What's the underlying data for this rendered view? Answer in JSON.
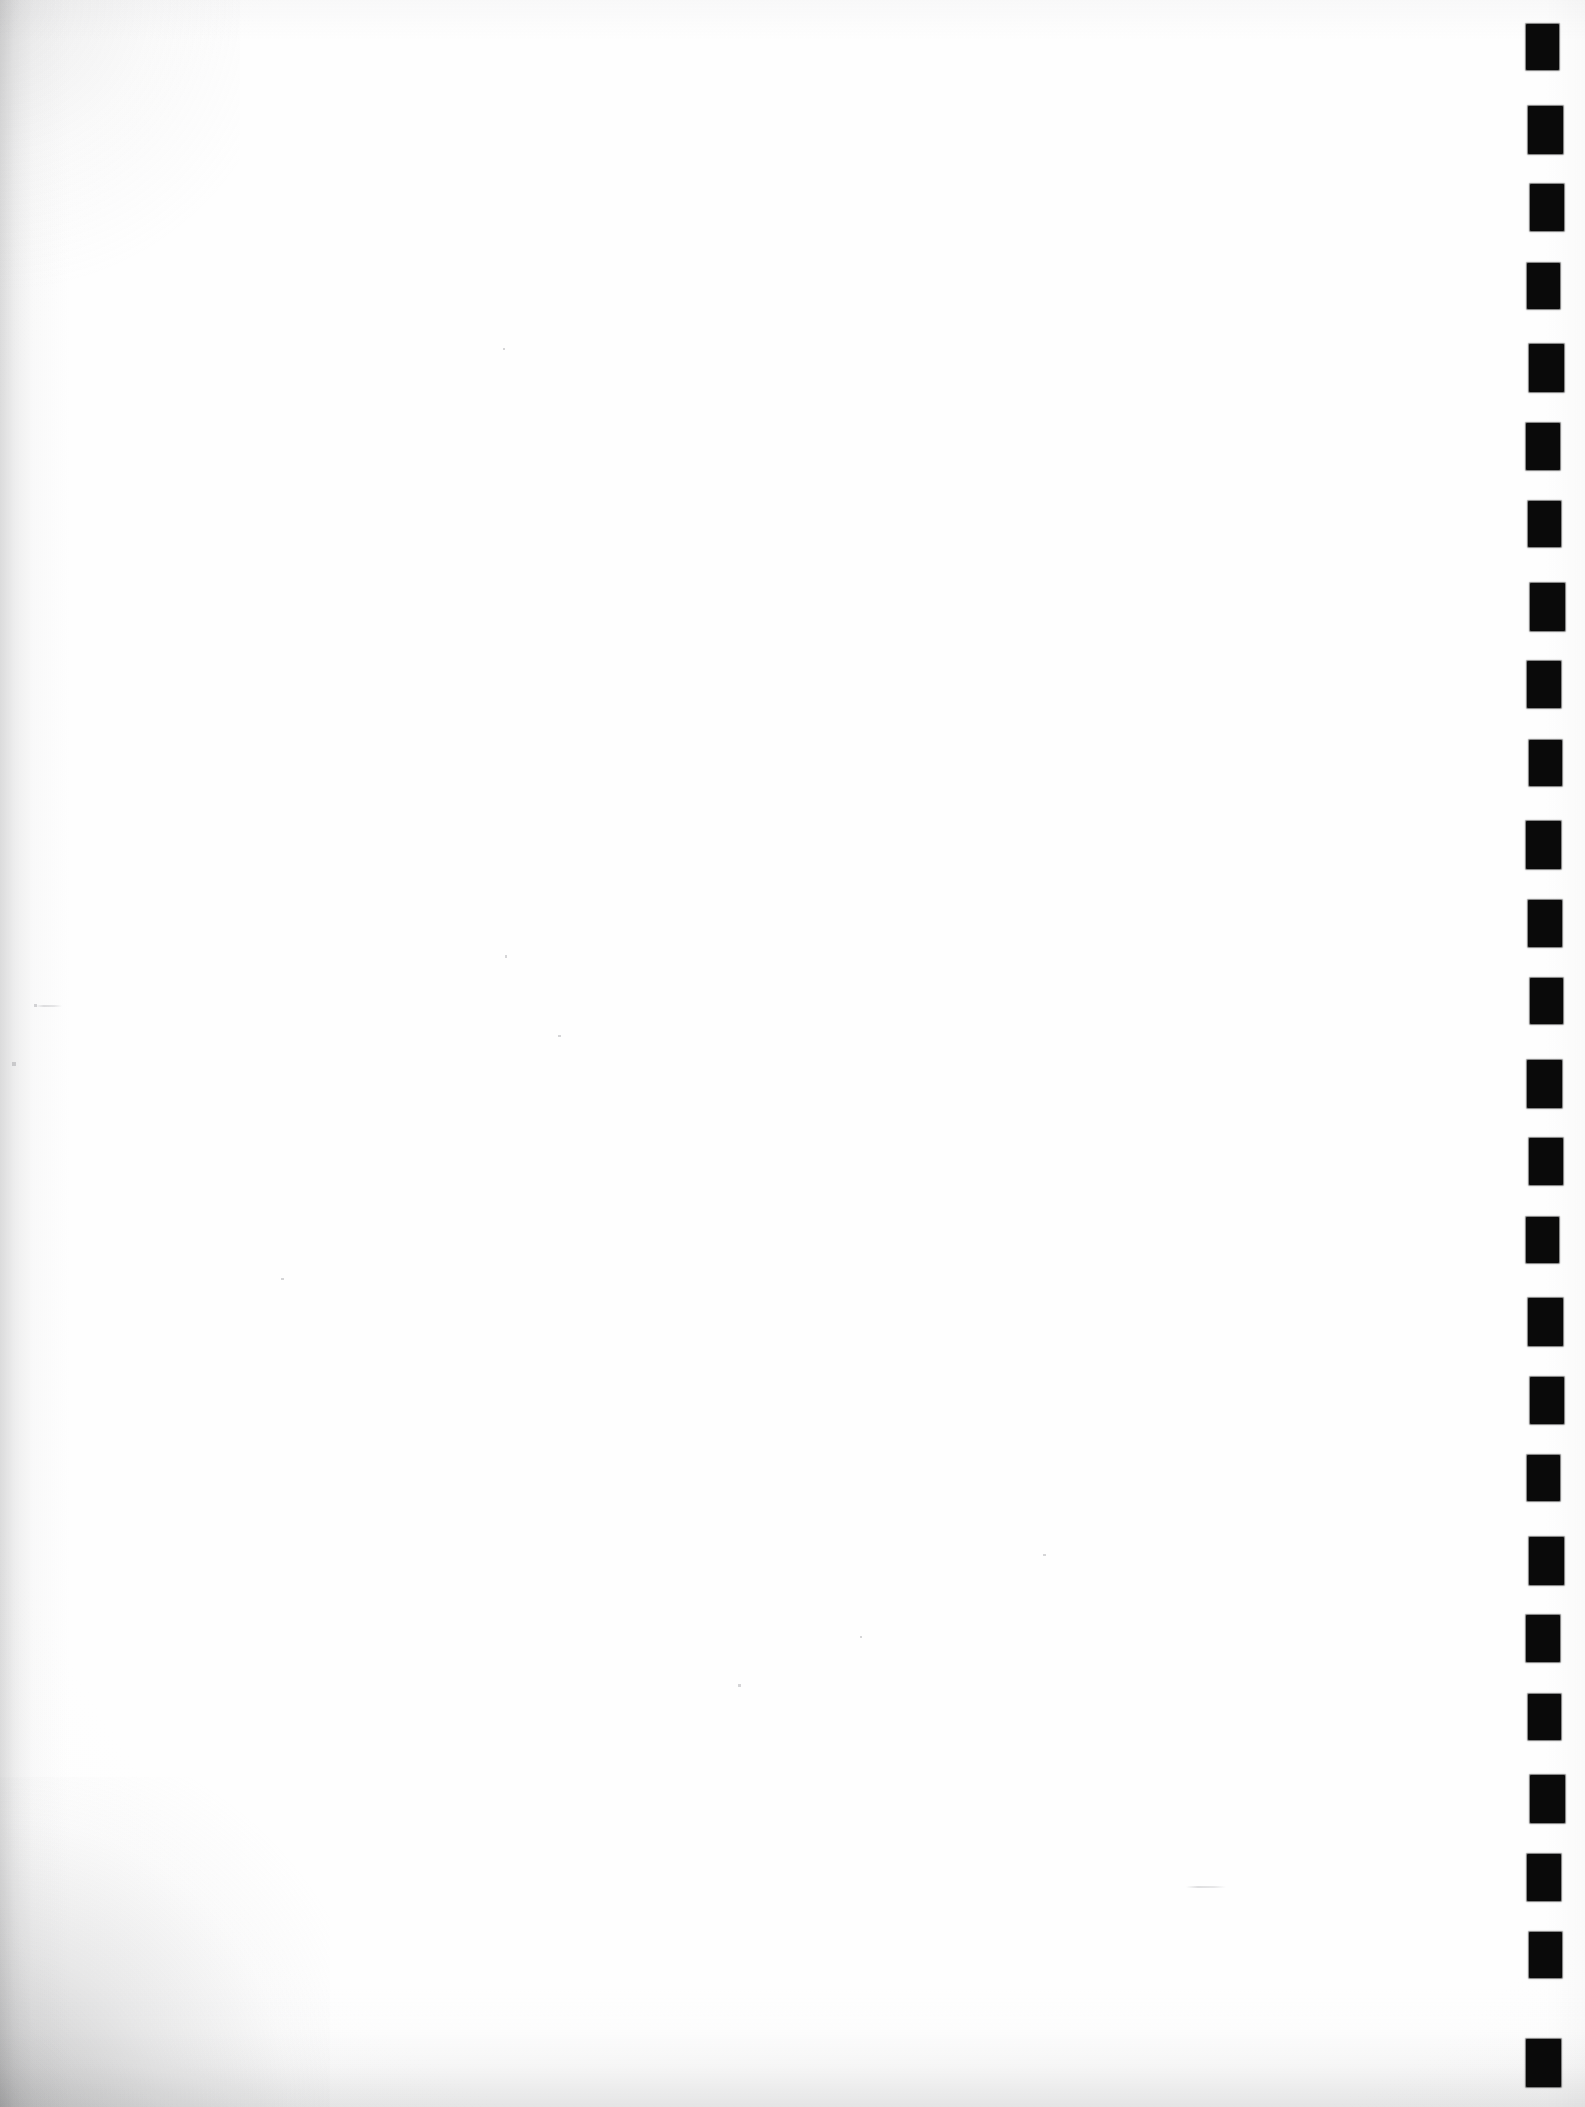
{
  "document": {
    "page_kind": "scanned-blank-page",
    "page_content_text": "",
    "visible_text": "",
    "orientation": "portrait",
    "width_px": 1585,
    "height_px": 2107
  },
  "colors": {
    "page_background": "#ffffff",
    "paper_tone": "#fdfdfd",
    "mark_color": "#0a0a0a",
    "edge_shadow": "#8a8a8c"
  },
  "registration_marks": {
    "name": "registration-mark-column",
    "description": "column of solid black rectangular timing marks along the right edge",
    "count": 26,
    "mark_width_px": 33,
    "mark_height_px": 46,
    "left_px": 1528,
    "first_top_px": 25,
    "pitch_px": 79.5,
    "tops_px": [
      25,
      104.5,
      184,
      263.5,
      343,
      422.5,
      502,
      581.5,
      661,
      740.5,
      820,
      899.5,
      979,
      1058.5,
      1138,
      1217.5,
      1297,
      1376.5,
      1456,
      1535.5,
      1615,
      1694.5,
      1774,
      1853.5,
      1933,
      2038
    ]
  },
  "artifacts": {
    "specks": [
      {
        "name": "scan-speck-left-upper",
        "x": 34,
        "y": 1004,
        "w": 3,
        "h": 3
      },
      {
        "name": "scan-speck-left-mid",
        "x": 12,
        "y": 1062,
        "w": 4,
        "h": 4
      },
      {
        "name": "scan-speck-center",
        "x": 558,
        "y": 1035,
        "w": 3,
        "h": 2
      },
      {
        "name": "scan-speck-upper-mid",
        "x": 505,
        "y": 955,
        "w": 2,
        "h": 3
      },
      {
        "name": "scan-speck-lower-mid",
        "x": 738,
        "y": 1684,
        "w": 3,
        "h": 3
      },
      {
        "name": "scan-speck-right-low",
        "x": 1043,
        "y": 1554,
        "w": 3,
        "h": 2
      },
      {
        "name": "scan-speck-mid-low",
        "x": 860,
        "y": 1636,
        "w": 2,
        "h": 2
      },
      {
        "name": "scan-speck-top-mid",
        "x": 503,
        "y": 348,
        "w": 2,
        "h": 2
      },
      {
        "name": "scan-speck-low-left",
        "x": 281,
        "y": 1278,
        "w": 3,
        "h": 2
      }
    ],
    "streaks": [
      {
        "name": "scan-streak-upper-left",
        "x": 36,
        "y": 1005,
        "w": 26,
        "h": 2
      },
      {
        "name": "scan-streak-lower-left",
        "x": 1186,
        "y": 1886,
        "w": 40,
        "h": 2
      }
    ]
  }
}
